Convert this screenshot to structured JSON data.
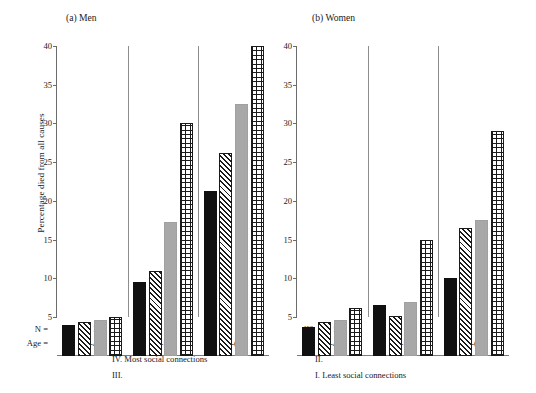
{
  "figure": {
    "ylabel": "Percentage died from all causes",
    "n_row_key": "N =",
    "age_row_key": "Age ="
  },
  "chart_data": {
    "type": "bar",
    "xlabel": "Age",
    "ylabel": "Percentage died from all causes",
    "ylim": [
      0,
      40
    ],
    "yticks": [
      5,
      10,
      15,
      20,
      25,
      30,
      35,
      40
    ],
    "ytick_labels": [
      "5",
      "10",
      "15",
      "20",
      "25",
      "30",
      "35",
      "40"
    ],
    "grid": false,
    "legend_position": "bottom",
    "series_names": [
      "IV. Most social connections",
      "III.",
      "II.",
      "I. Least social connections"
    ],
    "categories": [
      "30-49",
      "50-59",
      "60-69"
    ],
    "panels": [
      {
        "label": "(a) Men",
        "groups": [
          {
            "category": "30-49",
            "values": [
              4.0,
              4.3,
              4.6,
              5.0
            ],
            "n": [
              457,
              450,
              396,
              99
            ]
          },
          {
            "category": "50-59",
            "values": [
              9.5,
              10.9,
              17.3,
              30.0
            ],
            "n": [
              197,
              157,
              121,
              26
            ]
          },
          {
            "category": "60-69",
            "values": [
              21.3,
              26.2,
              32.5,
              40.0
            ],
            "n": [
              197,
              157,
              121,
              26
            ]
          }
        ]
      },
      {
        "label": "(b) Women",
        "groups": [
          {
            "category": "30-49",
            "values": [
              3.7,
              4.3,
              4.6,
              6.2
            ],
            "n": [
              460,
              402,
              514,
              159
            ]
          },
          {
            "category": "50-59",
            "values": [
              6.5,
              5.1,
              6.9,
              15.0
            ],
            "n": [
              205,
              112,
              188,
              59
            ]
          },
          {
            "category": "60-69",
            "values": [
              10.0,
              16.5,
              17.5,
              29.0
            ],
            "n": [
              93,
              78,
              158,
              58
            ]
          }
        ]
      }
    ]
  },
  "legend": {
    "items": [
      {
        "key": "iv",
        "label": "IV. Most social connections",
        "pattern": "solid-black",
        "color": "#101010"
      },
      {
        "key": "iii",
        "label": "III.",
        "pattern": "diagonal-hatch",
        "color": "#1a1a1a"
      },
      {
        "key": "ii",
        "label": "II.",
        "pattern": "solid-gray",
        "color": "#a8a8a8"
      },
      {
        "key": "i",
        "label": "I. Least social connections",
        "pattern": "grid",
        "color": "#1a1a1a"
      }
    ]
  }
}
